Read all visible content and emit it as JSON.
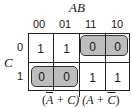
{
  "kmap": {
    "column_variable": "AB",
    "row_variable": "C",
    "column_headers": [
      "00",
      "01",
      "11",
      "10"
    ],
    "row_headers": [
      "0",
      "1"
    ],
    "cells": [
      [
        "1",
        "1",
        "0",
        "0"
      ],
      [
        "0",
        "0",
        "1",
        "1"
      ]
    ],
    "groups": [
      {
        "row": 0,
        "cols": [
          2,
          3
        ],
        "fill": "#bdbdbd",
        "label": "group-top-right-zeros"
      },
      {
        "row": 1,
        "cols": [
          0,
          1
        ],
        "fill": "#bdbdbd",
        "label": "group-bottom-left-zeros"
      }
    ],
    "expression": {
      "term1_open": "(",
      "term1_var1": "A",
      "term1_rest": " + C)",
      "spacer": " ",
      "term2_open": "(A + ",
      "term2_var2": "C",
      "term2_close": ")"
    }
  }
}
